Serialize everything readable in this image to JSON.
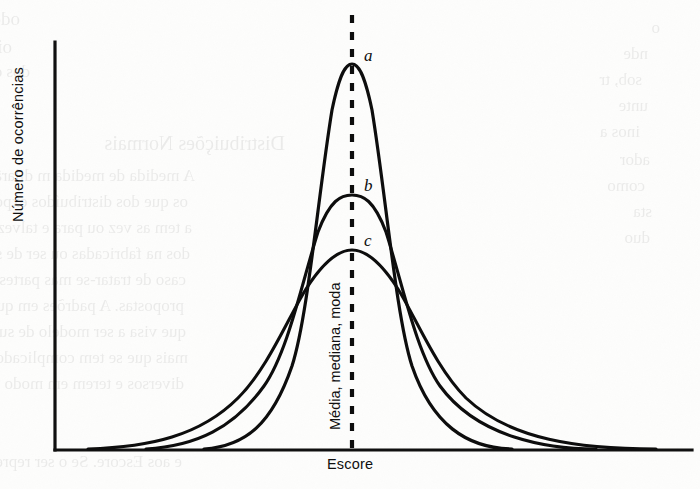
{
  "figure": {
    "axes": {
      "ylabel": "Número de ocorrências",
      "xlabel": "Escore"
    },
    "center_line_label": "Média, mediana, moda",
    "curve_tags": [
      {
        "id": "a",
        "label": "a"
      },
      {
        "id": "b",
        "label": "b"
      },
      {
        "id": "c",
        "label": "c"
      }
    ],
    "colors": {
      "ink": "#101010",
      "paper": "#fdfdfc"
    }
  },
  "ghost_text": [
    {
      "text": "odelo. Dois, em dela e",
      "x": 20,
      "y": 8,
      "size": 19
    },
    {
      "text": "oisa de um monte dele",
      "x": 12,
      "y": 36,
      "size": 19
    },
    {
      "text": "dos de do tomo",
      "x": 30,
      "y": 62,
      "size": 17
    },
    {
      "text": "o",
      "x": 660,
      "y": 18,
      "size": 17
    },
    {
      "text": "nde",
      "x": 648,
      "y": 44,
      "size": 17
    },
    {
      "text": "sob, tr",
      "x": 642,
      "y": 70,
      "size": 17
    },
    {
      "text": "unte",
      "x": 648,
      "y": 96,
      "size": 17
    },
    {
      "text": "inos a",
      "x": 640,
      "y": 122,
      "size": 17
    },
    {
      "text": "Distribuições Normais",
      "x": 285,
      "y": 132,
      "size": 20
    },
    {
      "text": "ador",
      "x": 650,
      "y": 150,
      "size": 17
    },
    {
      "text": "A medida de medida m dilarâm fr p lidades",
      "x": 195,
      "y": 166,
      "size": 17
    },
    {
      "text": "como",
      "x": 645,
      "y": 176,
      "size": 17
    },
    {
      "text": "os que dos distribuídos exponencial de",
      "x": 188,
      "y": 192,
      "size": 17
    },
    {
      "text": "sta",
      "x": 652,
      "y": 202,
      "size": 17
    },
    {
      "text": "a tem as vez ou para e talvez as que de",
      "x": 192,
      "y": 218,
      "size": 17
    },
    {
      "text": "duo",
      "x": 650,
      "y": 228,
      "size": 17
    },
    {
      "text": "dos na fabricadas ou ser de ser ás ad ri",
      "x": 190,
      "y": 244,
      "size": 17
    },
    {
      "text": "caso de tratar-se mas partes. Prolong",
      "x": 186,
      "y": 270,
      "size": 17
    },
    {
      "text": "propostas. A padrões em que consistência",
      "x": 184,
      "y": 296,
      "size": 17
    },
    {
      "text": "que visa a ser modelo de sua distribuição",
      "x": 186,
      "y": 322,
      "size": 17
    },
    {
      "text": "mais que se tem complicado mais de",
      "x": 188,
      "y": 348,
      "size": 17
    },
    {
      "text": "diversos e terem em modo de uma só ser",
      "x": 184,
      "y": 374,
      "size": 17
    },
    {
      "text": "e aos Escore. Se o ser representado, a o liv",
      "x": 182,
      "y": 452,
      "size": 17
    }
  ]
}
